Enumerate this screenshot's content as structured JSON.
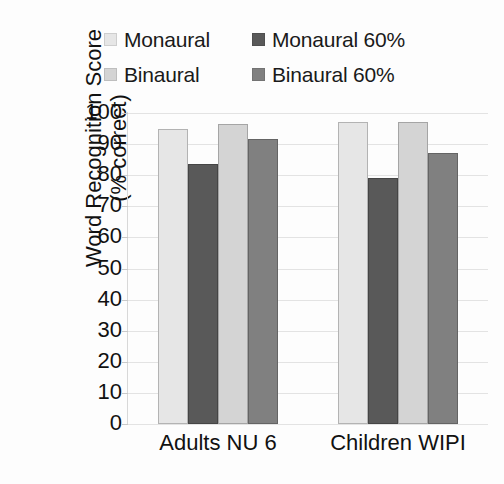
{
  "chart_data": {
    "type": "bar",
    "title": "",
    "subtitle": "",
    "xlabel": "",
    "ylabel": "Word Recognition Score (% correct)",
    "ylabel_line1": "Word Recognition Score",
    "ylabel_line2": "(% correct)",
    "categories": [
      "Adults NU 6",
      "Children WIPI"
    ],
    "ylim": [
      0,
      100
    ],
    "ytick_step": 10,
    "ytick_labels": [
      "100",
      "90",
      "80",
      "70",
      "60",
      "50",
      "40",
      "30",
      "20",
      "10",
      "0"
    ],
    "ytick_values": [
      100,
      90,
      80,
      70,
      60,
      50,
      40,
      30,
      20,
      10,
      0
    ],
    "grid": true,
    "grid_axis": "y",
    "legend_position": "top",
    "series": [
      {
        "name": "Monaural",
        "color": "#e6e6e6",
        "values": [
          95,
          97
        ]
      },
      {
        "name": "Monaural 60%",
        "color": "#595959",
        "values": [
          83.5,
          79
        ]
      },
      {
        "name": "Binaural",
        "color": "#d4d4d4",
        "values": [
          96.5,
          97
        ]
      },
      {
        "name": "Binaural 60%",
        "color": "#808080",
        "values": [
          91.5,
          87
        ]
      }
    ]
  }
}
